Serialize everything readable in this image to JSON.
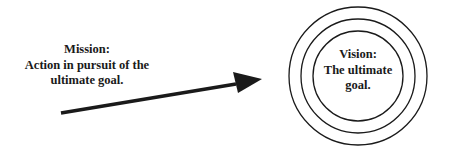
{
  "mission": {
    "lines": [
      "Mission:",
      "Action in pursuit of the",
      "ultimate goal."
    ]
  },
  "vision": {
    "lines": [
      "Vision:",
      "The ultimate",
      "goal."
    ]
  },
  "arrow": {
    "from": [
      61,
      113
    ],
    "to": [
      262,
      79
    ],
    "color": "#1a1a1a"
  },
  "target": {
    "center": [
      358,
      76
    ],
    "radii": [
      69,
      57,
      45
    ],
    "stroke": "#1a1a1a"
  }
}
